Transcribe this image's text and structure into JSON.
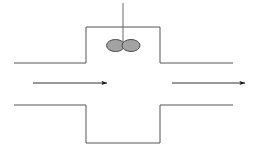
{
  "canvas": {
    "width": 255,
    "height": 151,
    "background": "#ffffff"
  },
  "style": {
    "line_color": "#555555",
    "wall_stroke_width": 1,
    "arrow_color": "#1a1a1a",
    "arrow_stroke_width": 0.9,
    "valve_fill": "#a3a3a3",
    "valve_stroke": "#4a4a4a",
    "stem_color": "#6b6b6b"
  },
  "diagram": {
    "geometry": {
      "left_pipe": {
        "name": "left-pipe",
        "x_start": 14,
        "x_end": 86,
        "top_wall_y": 63,
        "bottom_wall_y": 105
      },
      "right_pipe": {
        "name": "right-pipe",
        "x_start": 160,
        "x_end": 233,
        "top_wall_y": 63,
        "bottom_wall_y": 105
      },
      "center_chamber": {
        "name": "center-chamber",
        "left_wall_x": 86,
        "right_wall_x": 160,
        "top_wall_y": 27,
        "bottom_wall_y": 143
      },
      "valve_stem": {
        "name": "valve-stem",
        "x": 123,
        "y_top": 3,
        "y_bottom": 45
      },
      "valve_disc_left": {
        "name": "valve-disc-left-half",
        "cx": 115.5,
        "cy": 45.5,
        "rx": 9,
        "ry": 6
      },
      "valve_disc_right": {
        "name": "valve-disc-right-half",
        "cx": 131,
        "cy": 45.5,
        "rx": 9,
        "ry": 6
      },
      "flow_arrow_inlet": {
        "name": "flow-arrow-inlet",
        "x_start": 33,
        "x_end": 107,
        "y": 83,
        "direction": "right"
      },
      "flow_arrow_outlet": {
        "name": "flow-arrow-outlet",
        "x_start": 172,
        "x_end": 245,
        "y": 83,
        "direction": "right"
      }
    }
  }
}
